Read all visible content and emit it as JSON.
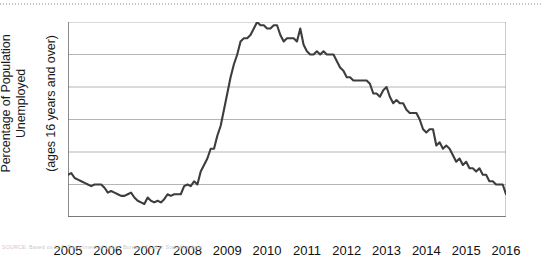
{
  "figure": {
    "source_note": "SOURCE: Based on U.S. Department of Labor, Bureau of Labor Statistics data."
  },
  "chart_data": {
    "type": "line",
    "title": "",
    "xlabel": "",
    "ylabel": "Percentage of Population Unemployed\n(ages 16 years and over)",
    "ylabel_line1": "Percentage of Population Unemployed",
    "ylabel_line2": "(ages 16 years and over)",
    "xlim": [
      2005,
      2016
    ],
    "ylim": [
      4,
      10
    ],
    "yticks": [
      4,
      5,
      6,
      7,
      8,
      9,
      10
    ],
    "ytick_labels": [
      "4",
      "5",
      "6",
      "7",
      "8",
      "9",
      "10"
    ],
    "xticks": [
      2005,
      2006,
      2007,
      2008,
      2009,
      2010,
      2011,
      2012,
      2013,
      2014,
      2015,
      2016
    ],
    "xtick_labels": [
      "2005",
      "2006",
      "2007",
      "2008",
      "2009",
      "2010",
      "2011",
      "2012",
      "2013",
      "2014",
      "2015",
      "2016"
    ],
    "grid": "horizontal",
    "legend": "none",
    "line_color": "#3d3d3d",
    "grid_color": "#b5b5b5",
    "axis_color": "#6f6f6f",
    "series": [
      {
        "name": "Unemployment rate",
        "x": [
          2005.0,
          2005.083,
          2005.167,
          2005.25,
          2005.333,
          2005.417,
          2005.5,
          2005.583,
          2005.667,
          2005.75,
          2005.833,
          2005.917,
          2006.0,
          2006.083,
          2006.167,
          2006.25,
          2006.333,
          2006.417,
          2006.5,
          2006.583,
          2006.667,
          2006.75,
          2006.833,
          2006.917,
          2007.0,
          2007.083,
          2007.167,
          2007.25,
          2007.333,
          2007.417,
          2007.5,
          2007.583,
          2007.667,
          2007.75,
          2007.833,
          2007.917,
          2008.0,
          2008.083,
          2008.167,
          2008.25,
          2008.333,
          2008.417,
          2008.5,
          2008.583,
          2008.667,
          2008.75,
          2008.833,
          2008.917,
          2009.0,
          2009.083,
          2009.167,
          2009.25,
          2009.333,
          2009.417,
          2009.5,
          2009.583,
          2009.667,
          2009.75,
          2009.833,
          2009.917,
          2010.0,
          2010.083,
          2010.167,
          2010.25,
          2010.333,
          2010.417,
          2010.5,
          2010.583,
          2010.667,
          2010.75,
          2010.833,
          2010.917,
          2011.0,
          2011.083,
          2011.167,
          2011.25,
          2011.333,
          2011.417,
          2011.5,
          2011.583,
          2011.667,
          2011.75,
          2011.833,
          2011.917,
          2012.0,
          2012.083,
          2012.167,
          2012.25,
          2012.333,
          2012.417,
          2012.5,
          2012.583,
          2012.667,
          2012.75,
          2012.833,
          2012.917,
          2013.0,
          2013.083,
          2013.167,
          2013.25,
          2013.333,
          2013.417,
          2013.5,
          2013.583,
          2013.667,
          2013.75,
          2013.833,
          2013.917,
          2014.0,
          2014.083,
          2014.167,
          2014.25,
          2014.333,
          2014.417,
          2014.5,
          2014.583,
          2014.667,
          2014.75,
          2014.833,
          2014.917,
          2015.0,
          2015.083,
          2015.167,
          2015.25,
          2015.333,
          2015.417,
          2015.5,
          2015.583,
          2015.667,
          2015.75,
          2015.833,
          2015.917,
          2016.0
        ],
        "values": [
          5.3,
          5.35,
          5.2,
          5.15,
          5.1,
          5.05,
          5.0,
          4.95,
          5.0,
          5.0,
          5.0,
          4.9,
          4.75,
          4.8,
          4.75,
          4.7,
          4.65,
          4.65,
          4.7,
          4.75,
          4.6,
          4.5,
          4.45,
          4.4,
          4.6,
          4.5,
          4.45,
          4.5,
          4.45,
          4.55,
          4.7,
          4.65,
          4.7,
          4.7,
          4.7,
          4.95,
          5.0,
          4.95,
          5.1,
          5.0,
          5.4,
          5.6,
          5.8,
          6.1,
          6.1,
          6.5,
          6.8,
          7.3,
          7.8,
          8.3,
          8.7,
          9.0,
          9.4,
          9.5,
          9.5,
          9.6,
          9.8,
          10.0,
          9.9,
          9.9,
          9.8,
          9.8,
          9.9,
          9.9,
          9.6,
          9.4,
          9.5,
          9.5,
          9.5,
          9.4,
          9.8,
          9.3,
          9.1,
          9.0,
          9.0,
          9.1,
          9.0,
          9.1,
          9.0,
          9.0,
          9.0,
          8.8,
          8.6,
          8.5,
          8.3,
          8.3,
          8.2,
          8.2,
          8.2,
          8.2,
          8.2,
          8.1,
          7.8,
          7.8,
          7.7,
          7.9,
          8.0,
          7.7,
          7.5,
          7.6,
          7.5,
          7.5,
          7.3,
          7.2,
          7.2,
          7.2,
          7.0,
          6.7,
          6.6,
          6.7,
          6.7,
          6.2,
          6.3,
          6.1,
          6.2,
          6.1,
          5.9,
          5.7,
          5.8,
          5.6,
          5.7,
          5.5,
          5.5,
          5.4,
          5.5,
          5.3,
          5.3,
          5.1,
          5.1,
          5.0,
          5.0,
          5.0,
          4.7
        ]
      }
    ]
  }
}
